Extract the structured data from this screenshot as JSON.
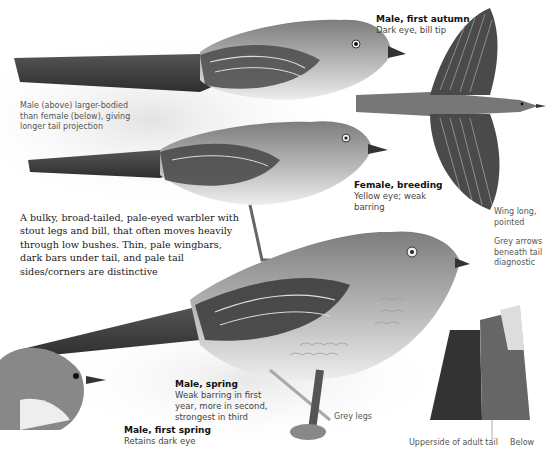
{
  "labels": {
    "male_first_autumn": {
      "title": "Male, first autumn",
      "sub": "Dark eye, bill tip"
    },
    "female_breeding": {
      "title": "Female, breeding",
      "sub_lines": [
        "Yellow eye; weak",
        "barring"
      ]
    },
    "male_spring": {
      "title": "Male, spring",
      "sub_lines": [
        "Weak barring in first",
        "year, more in second,",
        "strongest in third"
      ]
    },
    "male_first_spring": {
      "title": "Male, first spring",
      "sub": "Retains dark eye"
    }
  },
  "notes": {
    "size_comparison": [
      "Male (above) larger-bodied",
      "than female (below), giving",
      "longer tail projection"
    ],
    "wing": [
      "Wing long,",
      "pointed"
    ],
    "grey_arrows": [
      "Grey arrows",
      "beneath tail",
      "diagnostic"
    ],
    "legs": "Grey legs",
    "tail_upperside": "Upperside of adult tail",
    "tail_below": "Below"
  },
  "description": "A bulky, broad-tailed, pale-eyed warbler with stout legs and bill, that often moves heavily through low bushes. Thin, pale wingbars, dark bars under tail, and pale tail sides/corners are distinctive",
  "colors": {
    "ink": "#111111",
    "text_grey": "#555555",
    "bird_dark": "#3c3c3c",
    "bird_mid": "#8a8a8a",
    "bird_light": "#d8d8d8"
  }
}
